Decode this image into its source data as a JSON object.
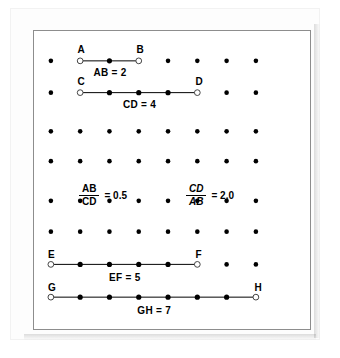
{
  "figure": {
    "background_color": "#ffffff",
    "frame_color": "#8d8d8d",
    "dot_color": "#000000",
    "segment_color": "#000000"
  },
  "grid": {
    "columns": 8,
    "rows": 8,
    "col_x": [
      17,
      46.5,
      76,
      105.5,
      135,
      164.5,
      194,
      223.5
    ],
    "row_y": [
      30,
      62,
      101,
      131,
      171,
      202,
      235,
      268
    ],
    "dot_radius": 2.3
  },
  "segments": [
    {
      "name": "AB",
      "start_label": "A",
      "end_label": "B",
      "length": 2,
      "length_label": "AB = 2",
      "row": 0,
      "start_col": 1,
      "end_col": 3,
      "interior_points": 1
    },
    {
      "name": "CD",
      "start_label": "C",
      "end_label": "D",
      "length": 4,
      "length_label": "CD = 4",
      "row": 1,
      "start_col": 1,
      "end_col": 5,
      "interior_points": 3
    },
    {
      "name": "EF",
      "start_label": "E",
      "end_label": "F",
      "length": 5,
      "length_label": "EF = 5",
      "row": 6,
      "start_col": 0,
      "end_col": 5,
      "interior_points": 4
    },
    {
      "name": "GH",
      "start_label": "G",
      "end_label": "H",
      "length": 7,
      "length_label": "GH = 7",
      "row": 7,
      "start_col": 0,
      "end_col": 7,
      "interior_points": 6
    }
  ],
  "ratios": [
    {
      "numerator": "AB",
      "denominator": "CD",
      "equals": "= 0.5",
      "value": 0.5,
      "style": "upright",
      "x": 45,
      "y": 153
    },
    {
      "numerator": "CD",
      "denominator": "AB",
      "equals": "= 2.0",
      "value": 2.0,
      "style": "italic",
      "x": 152,
      "y": 153
    }
  ],
  "chart_data": {
    "type": "diagram",
    "categories": [
      "AB",
      "CD",
      "EF",
      "GH"
    ],
    "values": [
      2,
      4,
      5,
      7
    ],
    "ylabel": "length (grid units)",
    "annotations": [
      "AB = 2",
      "CD = 4",
      "AB/CD = 0.5",
      "CD/AB = 2.0",
      "EF = 5",
      "GH = 7"
    ]
  }
}
